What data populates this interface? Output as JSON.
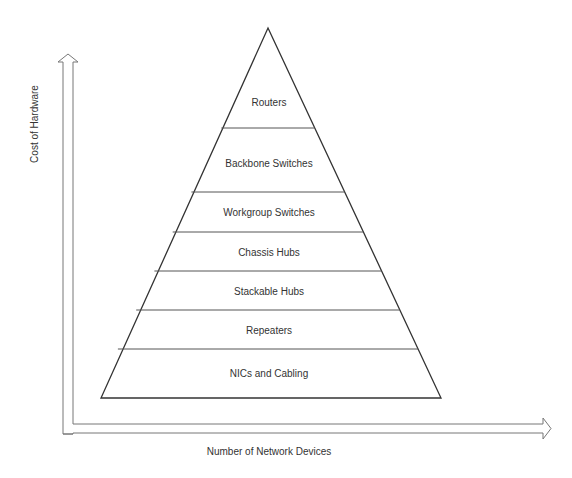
{
  "diagram": {
    "type": "pyramid",
    "y_axis_label": "Cost of Hardware",
    "x_axis_label": "Number of Network Devices",
    "tiers": [
      {
        "label": "Routers"
      },
      {
        "label": "Backbone Switches"
      },
      {
        "label": "Workgroup Switches"
      },
      {
        "label": "Chassis Hubs"
      },
      {
        "label": "Stackable Hubs"
      },
      {
        "label": "Repeaters"
      },
      {
        "label": "NICs and Cabling"
      }
    ],
    "colors": {
      "line": "#333333",
      "axis": "#777777",
      "background": "#ffffff"
    }
  }
}
